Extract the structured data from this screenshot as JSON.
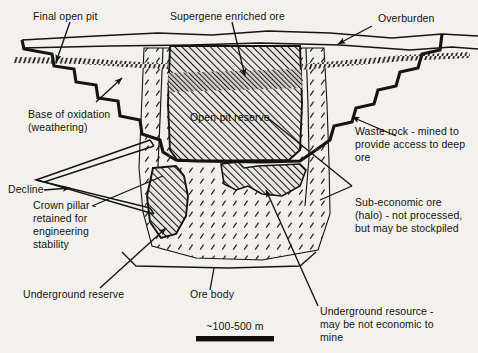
{
  "figure": {
    "type": "geological-cross-section",
    "background_color": "#f2f1ee",
    "line_color": "#15140f",
    "scale": {
      "label": "~100-500 m",
      "bar_color": "#100f0c"
    }
  },
  "labels": {
    "final_open_pit": "Final open pit",
    "supergene_enriched_ore": "Supergene enriched ore",
    "overburden": "Overburden",
    "base_of_oxidation_line1": "Base of oxidation",
    "base_of_oxidation_line2": "(weathering)",
    "open_pit_reserve": "Open-pit reserve",
    "waste_rock_line1": "Waste rock - mined to",
    "waste_rock_line2": "provide access to deep",
    "waste_rock_line3": "ore",
    "decline": "Decline",
    "crown_pillar_line1": "Crown pillar -",
    "crown_pillar_line2": "retained for",
    "crown_pillar_line3": "engineering",
    "crown_pillar_line4": "stability",
    "sub_economic_line1": "Sub-economic ore",
    "sub_economic_line2": "(halo) - not processed,",
    "sub_economic_line3": "but may be stockpiled",
    "underground_reserve": "Underground reserve",
    "ore_body": "Ore body",
    "underground_resource_line1": "Underground resource -",
    "underground_resource_line2": "may be not economic to",
    "underground_resource_line3": "mine"
  },
  "regions": [
    {
      "name": "overburden",
      "description": "Thin surface layer above the bedrock, bounded by two near-horizontal wavy lines",
      "fill": "none"
    },
    {
      "name": "base-of-oxidation",
      "description": "Hatched dashed band crossing the section, marking the weathering front",
      "fill": "dashed-hatch"
    },
    {
      "name": "open-pit-reserve",
      "description": "Central diagonally hatched block inside the pit, the economic open pit ore",
      "fill": "diagonal-hatch"
    },
    {
      "name": "supergene-enriched-ore",
      "description": "Darker dense hatch band within the upper part of the open-pit reserve",
      "fill": "dense-hatch"
    },
    {
      "name": "sub-economic-halo",
      "description": "Tick-stippled halo surrounding the ore body on both sides and below",
      "fill": "tick-stipple"
    },
    {
      "name": "underground-reserve-crown-pillar",
      "description": "Hatched lens below the pit floor, left of centre, the underground reserve with crown pillar above",
      "fill": "diagonal-hatch"
    },
    {
      "name": "underground-resource",
      "description": "Hatched lens below the pit floor, right of centre, the deeper underground resource",
      "fill": "diagonal-hatch"
    },
    {
      "name": "decline",
      "description": "Double-line V-shaped access ramp entering from the left pit wall down to the underground workings",
      "fill": "none"
    },
    {
      "name": "final-open-pit-wall",
      "description": "Benched (stepped) heavy outline of the final pit on both walls",
      "fill": "none"
    }
  ]
}
